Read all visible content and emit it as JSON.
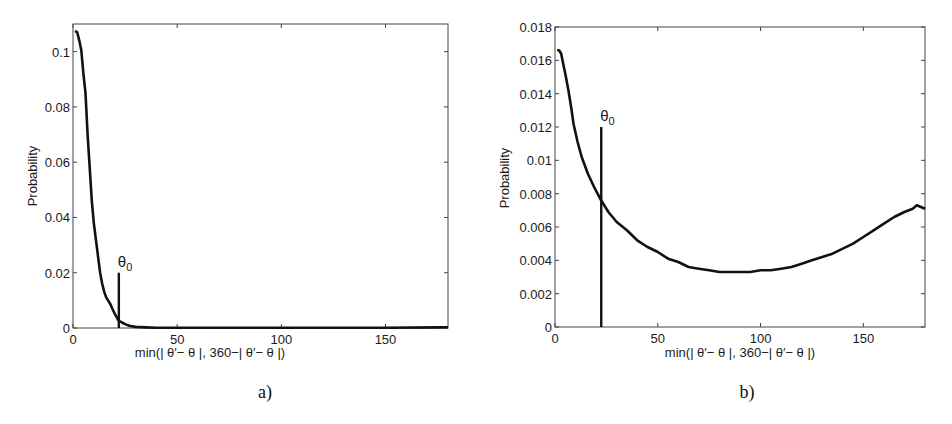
{
  "figure": {
    "panels": [
      {
        "id": "a",
        "caption": "a)"
      },
      {
        "id": "b",
        "caption": "b)"
      }
    ]
  },
  "chart_data": [
    {
      "type": "line",
      "panel": "a)",
      "title": "",
      "xlabel": "min(| θ′− θ |, 360−| θ′− θ |)",
      "ylabel": "Probability",
      "xlim": [
        0,
        180
      ],
      "ylim": [
        0,
        0.11
      ],
      "xticks": [
        0,
        50,
        100,
        150
      ],
      "xtick_labels": [
        "0",
        "50",
        "100",
        "150"
      ],
      "yticks": [
        0,
        0.02,
        0.04,
        0.06,
        0.08,
        0.1
      ],
      "ytick_labels": [
        "0",
        "0.02",
        "0.04",
        "0.06",
        "0.08",
        "0.1"
      ],
      "grid": false,
      "legend": null,
      "series": [
        {
          "name": "probability",
          "color": "#111111",
          "x": [
            1,
            2,
            3,
            4,
            5,
            6,
            7,
            8,
            9,
            10,
            11,
            12,
            13,
            14,
            15,
            16,
            17,
            18,
            19,
            20,
            21,
            22,
            23,
            24,
            25,
            27,
            30,
            35,
            40,
            50,
            75,
            100,
            125,
            150,
            175,
            180
          ],
          "y": [
            0.1075,
            0.107,
            0.104,
            0.1005,
            0.092,
            0.085,
            0.07,
            0.058,
            0.046,
            0.038,
            0.032,
            0.026,
            0.02,
            0.016,
            0.013,
            0.011,
            0.0098,
            0.0085,
            0.0068,
            0.0052,
            0.0038,
            0.0026,
            0.0022,
            0.0018,
            0.0014,
            0.0008,
            0.0004,
            0.0002,
            0.0001,
            0.0001,
            0.0001,
            0.0001,
            0.0001,
            0.0001,
            0.0002,
            0.0003
          ]
        }
      ],
      "annotations": [
        {
          "type": "vline",
          "label": "θ",
          "label_sub": "0",
          "x": 22,
          "y_top": 0.02
        }
      ]
    },
    {
      "type": "line",
      "panel": "b)",
      "title": "",
      "xlabel": "min(| θ′− θ |, 360−| θ′− θ |)",
      "ylabel": "Probability",
      "xlim": [
        0,
        180
      ],
      "ylim": [
        0,
        0.018
      ],
      "xticks": [
        0,
        50,
        100,
        150
      ],
      "xtick_labels": [
        "0",
        "50",
        "100",
        "150"
      ],
      "yticks": [
        0,
        0.002,
        0.004,
        0.006,
        0.008,
        0.01,
        0.012,
        0.014,
        0.016,
        0.018
      ],
      "ytick_labels": [
        "0",
        "0.002",
        "0.004",
        "0.006",
        "0.008",
        "0.01",
        "0.012",
        "0.014",
        "0.016",
        "0.018"
      ],
      "grid": false,
      "legend": null,
      "series": [
        {
          "name": "probability",
          "color": "#111111",
          "x": [
            1,
            2,
            3,
            4,
            5,
            6.5,
            8,
            9,
            11,
            13,
            16,
            19,
            22,
            26,
            30,
            35,
            40,
            45,
            50,
            55,
            60,
            65,
            70,
            75,
            80,
            85,
            90,
            95,
            100,
            105,
            110,
            115,
            120,
            125,
            130,
            135,
            140,
            145,
            150,
            155,
            160,
            165,
            170,
            174,
            176,
            178,
            180
          ],
          "y": [
            0.0166,
            0.0166,
            0.0164,
            0.0158,
            0.0152,
            0.0142,
            0.0131,
            0.0122,
            0.0111,
            0.0102,
            0.0092,
            0.0084,
            0.0077,
            0.0069,
            0.0063,
            0.0058,
            0.0052,
            0.0048,
            0.0045,
            0.0041,
            0.0039,
            0.0036,
            0.0035,
            0.0034,
            0.0033,
            0.0033,
            0.0033,
            0.0033,
            0.0034,
            0.0034,
            0.0035,
            0.0036,
            0.0038,
            0.004,
            0.0042,
            0.0044,
            0.0047,
            0.005,
            0.0054,
            0.0058,
            0.0062,
            0.0066,
            0.0069,
            0.0071,
            0.0073,
            0.0072,
            0.0071
          ]
        }
      ],
      "annotations": [
        {
          "type": "vline",
          "label": "θ",
          "label_sub": "0",
          "x": 22.5,
          "y_top": 0.012
        }
      ]
    }
  ]
}
